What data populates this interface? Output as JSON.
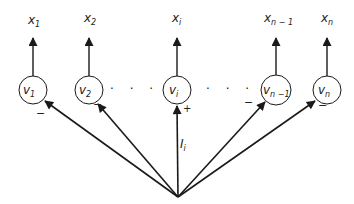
{
  "diagram": {
    "type": "neural-network-winner-take-all",
    "colors": {
      "stroke": "#1a1a1a",
      "background": "#ffffff"
    },
    "nodes": [
      {
        "id": "v1",
        "label": "v",
        "sub": "1",
        "output_label": "x",
        "output_sub": "1",
        "input_sign": "−"
      },
      {
        "id": "v2",
        "label": "v",
        "sub": "2",
        "output_label": "x",
        "output_sub": "2",
        "input_sign": "−"
      },
      {
        "id": "vi",
        "label": "v",
        "sub": "i",
        "output_label": "x",
        "output_sub": "i",
        "input_sign": "+"
      },
      {
        "id": "vn-1",
        "label": "v",
        "sub": "n −1",
        "output_label": "x",
        "output_sub": "n − 1",
        "input_sign": "−"
      },
      {
        "id": "vn",
        "label": "v",
        "sub": "n",
        "output_label": "x",
        "output_sub": "n",
        "input_sign": "−"
      }
    ],
    "ellipsis": "· · ·",
    "input_label": "I",
    "input_sub": "i"
  }
}
